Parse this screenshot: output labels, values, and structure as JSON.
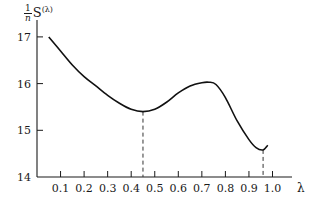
{
  "chart_data": {
    "type": "line",
    "title": "",
    "ylabel": "(1/n) S(λ)",
    "ylabel_parts": {
      "num": "1",
      "den": "n",
      "main": "S",
      "sup": "(λ)"
    },
    "xlabel": "λ",
    "xlim": [
      0.0,
      1.05
    ],
    "ylim": [
      14,
      17.3
    ],
    "x_ticks": [
      0.1,
      0.2,
      0.3,
      0.4,
      0.5,
      0.6,
      0.7,
      0.8,
      0.9,
      1.0
    ],
    "x_tick_labels": [
      "0.1",
      "0.2",
      "0.3",
      "0.4",
      "0.5",
      "0.6",
      "0.7",
      "0.8",
      "0.9",
      "1.0"
    ],
    "y_ticks": [
      14,
      15,
      16,
      17
    ],
    "y_tick_labels": [
      "14",
      "15",
      "16",
      "17"
    ],
    "grid": false,
    "legend": null,
    "series": [
      {
        "name": "S(λ)/n",
        "x": [
          0.05,
          0.1,
          0.15,
          0.2,
          0.25,
          0.3,
          0.35,
          0.4,
          0.45,
          0.5,
          0.55,
          0.6,
          0.65,
          0.7,
          0.73,
          0.76,
          0.8,
          0.85,
          0.9,
          0.93,
          0.96,
          0.98
        ],
        "y": [
          17.0,
          16.7,
          16.4,
          16.15,
          15.95,
          15.75,
          15.58,
          15.45,
          15.4,
          15.45,
          15.6,
          15.8,
          15.95,
          16.02,
          16.03,
          15.98,
          15.7,
          15.2,
          14.8,
          14.63,
          14.58,
          14.68
        ]
      }
    ],
    "annotations": [
      {
        "type": "vline-dashed",
        "x": 0.45,
        "y_to": 15.4,
        "note": "first minimum"
      },
      {
        "type": "vline-dashed",
        "x": 0.96,
        "y_to": 14.58,
        "note": "second minimum"
      }
    ]
  }
}
